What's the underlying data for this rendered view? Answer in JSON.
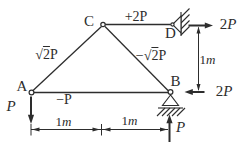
{
  "figure_type": "truss free-body diagram",
  "ink_color": "#2d2d2d",
  "background_color": "#ffffff",
  "nodes": {
    "A": {
      "label": "A"
    },
    "B": {
      "label": "B"
    },
    "C": {
      "label": "C"
    },
    "D": {
      "label": "D"
    }
  },
  "member_forces": {
    "AC": {
      "sign": "",
      "radical": "√",
      "radicand": "2",
      "rest": "P"
    },
    "CB": {
      "sign": "−",
      "radical": "√",
      "radicand": "2",
      "rest": "P"
    },
    "CD": {
      "sign": "+",
      "radical": "",
      "radicand": "",
      "rest": "2P"
    },
    "AB": {
      "sign": "−",
      "radical": "",
      "radicand": "",
      "rest": "P"
    }
  },
  "loads": {
    "A_down": {
      "value": "",
      "symbol": "P",
      "direction": "down"
    },
    "D_right": {
      "value": "2",
      "symbol": "P",
      "direction": "right"
    },
    "B_left": {
      "value": "2",
      "symbol": "P",
      "direction": "left"
    },
    "B_up": {
      "value": "",
      "symbol": "P",
      "direction": "up"
    }
  },
  "dimensions": {
    "bottom_left": {
      "value": "1",
      "unit": "m"
    },
    "bottom_right": {
      "value": "1",
      "unit": "m"
    },
    "right_vertical": {
      "value": "1",
      "unit": "m"
    }
  },
  "supports": {
    "B": "pin-support-hatched-ground",
    "D": "pin-support-hatched-wall"
  }
}
